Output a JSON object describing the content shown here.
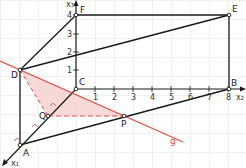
{
  "diagram": {
    "type": "3d-coordinate-geometry",
    "axes": {
      "x1_label": "x₁",
      "x2_label": "x₂",
      "x3_label": "x₃",
      "x2_ticks": [
        "1",
        "2",
        "3",
        "4",
        "5",
        "6",
        "7",
        "8"
      ],
      "x3_ticks": [
        "1",
        "2",
        "3",
        "4"
      ]
    },
    "points": {
      "A": "A",
      "B": "B",
      "C": "C",
      "D": "D",
      "E": "E",
      "F": "F",
      "P": "P",
      "Q": "Q"
    },
    "line_label": "g",
    "colors": {
      "grid": "#d8d8d8",
      "line": "#1a1a1a",
      "accent_red": "#e0504a",
      "shade": "#f6d3d1"
    }
  }
}
